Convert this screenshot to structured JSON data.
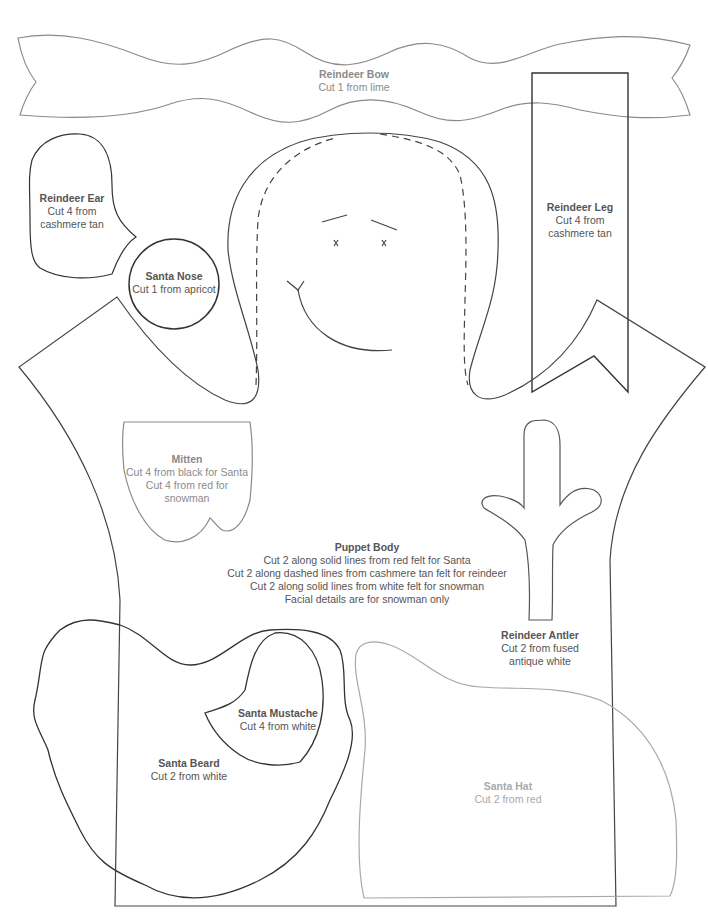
{
  "colors": {
    "outline_dark": "#333333",
    "outline_mid": "#777777",
    "outline_light": "#a8a8a8",
    "text_dark": "#555555",
    "text_mid": "#8a8a8a",
    "text_light": "#a9a9a9"
  },
  "pieces": {
    "reindeer_bow": {
      "title": "Reindeer Bow",
      "lines": [
        "Cut 1 from lime"
      ]
    },
    "reindeer_ear": {
      "title": "Reindeer Ear",
      "lines": [
        "Cut 4 from",
        "cashmere tan"
      ]
    },
    "santa_nose": {
      "title": "Santa Nose",
      "lines": [
        "Cut 1 from apricot"
      ]
    },
    "reindeer_leg": {
      "title": "Reindeer Leg",
      "lines": [
        "Cut 4 from",
        "cashmere tan"
      ]
    },
    "mitten": {
      "title": "Mitten",
      "lines": [
        "Cut 4 from black for Santa",
        "Cut 4 from red for",
        "snowman"
      ]
    },
    "puppet_body": {
      "title": "Puppet Body",
      "lines": [
        "Cut 2 along solid lines from red felt for Santa",
        "Cut 2 along dashed lines from cashmere tan felt for reindeer",
        "Cut 2 along solid lines from white felt for snowman",
        "Facial details are for snowman only"
      ]
    },
    "reindeer_antler": {
      "title": "Reindeer Antler",
      "lines": [
        "Cut 2 from fused",
        "antique white"
      ]
    },
    "santa_mustache": {
      "title": "Santa Mustache",
      "lines": [
        "Cut 4 from white"
      ]
    },
    "santa_beard": {
      "title": "Santa Beard",
      "lines": [
        "Cut 2 from white"
      ]
    },
    "santa_hat": {
      "title": "Santa Hat",
      "lines": [
        "Cut 2 from red"
      ]
    }
  },
  "face_details": {
    "eye_mark": "x"
  }
}
